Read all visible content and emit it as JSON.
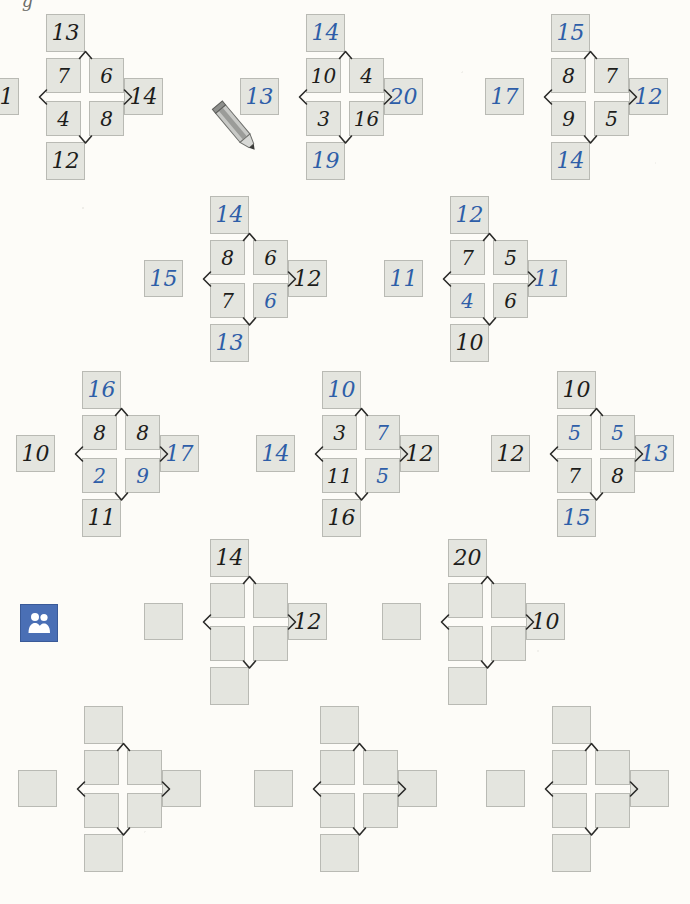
{
  "page": {
    "type": "math-worksheet",
    "topic": "cross-number-puzzles",
    "top_mark": "g",
    "colors": {
      "paper": "#fdfcf8",
      "box_fill": "#e4e5df",
      "box_border": "#b9bab4",
      "given_number": "#1d1d1b",
      "answer_number": "#2e5ea8",
      "partner_icon_bg": "#4a6fb5"
    }
  },
  "icons": {
    "pencil": "pencil-icon",
    "partner": "partner-work-icon"
  },
  "puzzles": [
    {
      "id": 1,
      "left": 8,
      "top": 20,
      "cells": {
        "tl": "7",
        "tr": "6",
        "bl": "4",
        "br": "8"
      },
      "colors": {
        "tl": "black",
        "tr": "black",
        "bl": "black",
        "br": "black"
      },
      "outer": {
        "top": "13",
        "bottom": "12",
        "left": "11",
        "right": "14"
      },
      "outer_colors": {
        "top": "black",
        "bottom": "black",
        "left": "black",
        "right": "black"
      }
    },
    {
      "id": 2,
      "left": 268,
      "top": 20,
      "cells": {
        "tl": "10",
        "tr": "4",
        "bl": "3",
        "br": "16"
      },
      "colors": {
        "tl": "black",
        "tr": "black",
        "bl": "black",
        "br": "black"
      },
      "outer": {
        "top": "14",
        "bottom": "19",
        "left": "13",
        "right": "20"
      },
      "outer_colors": {
        "top": "blue",
        "bottom": "blue",
        "left": "blue",
        "right": "blue"
      }
    },
    {
      "id": 3,
      "left": 513,
      "top": 20,
      "cells": {
        "tl": "8",
        "tr": "7",
        "bl": "9",
        "br": "5"
      },
      "colors": {
        "tl": "black",
        "tr": "black",
        "bl": "black",
        "br": "black"
      },
      "outer": {
        "top": "15",
        "bottom": "14",
        "left": "17",
        "right": "12"
      },
      "outer_colors": {
        "top": "blue",
        "bottom": "blue",
        "left": "blue",
        "right": "blue"
      }
    },
    {
      "id": 4,
      "left": 172,
      "top": 202,
      "cells": {
        "tl": "8",
        "tr": "6",
        "bl": "7",
        "br": "6"
      },
      "colors": {
        "tl": "black",
        "tr": "black",
        "bl": "black",
        "br": "blue"
      },
      "outer": {
        "top": "14",
        "bottom": "13",
        "left": "15",
        "right": "12"
      },
      "outer_colors": {
        "top": "blue",
        "bottom": "blue",
        "left": "blue",
        "right": "black"
      }
    },
    {
      "id": 5,
      "left": 412,
      "top": 202,
      "cells": {
        "tl": "7",
        "tr": "5",
        "bl": "4",
        "br": "6"
      },
      "colors": {
        "tl": "black",
        "tr": "black",
        "bl": "blue",
        "br": "black"
      },
      "outer": {
        "top": "12",
        "bottom": "10",
        "left": "11",
        "right": "11"
      },
      "outer_colors": {
        "top": "blue",
        "bottom": "black",
        "left": "blue",
        "right": "blue"
      }
    },
    {
      "id": 6,
      "left": 44,
      "top": 377,
      "cells": {
        "tl": "8",
        "tr": "8",
        "bl": "2",
        "br": "9"
      },
      "colors": {
        "tl": "black",
        "tr": "black",
        "bl": "blue",
        "br": "blue"
      },
      "outer": {
        "top": "16",
        "bottom": "11",
        "left": "10",
        "right": "17"
      },
      "outer_colors": {
        "top": "blue",
        "bottom": "black",
        "left": "black",
        "right": "blue"
      }
    },
    {
      "id": 7,
      "left": 284,
      "top": 377,
      "cells": {
        "tl": "3",
        "tr": "7",
        "bl": "11",
        "br": "5"
      },
      "colors": {
        "tl": "black",
        "tr": "blue",
        "bl": "black",
        "br": "blue"
      },
      "outer": {
        "top": "10",
        "bottom": "16",
        "left": "14",
        "right": "12"
      },
      "outer_colors": {
        "top": "blue",
        "bottom": "black",
        "left": "blue",
        "right": "black"
      }
    },
    {
      "id": 8,
      "left": 519,
      "top": 377,
      "cells": {
        "tl": "5",
        "tr": "5",
        "bl": "7",
        "br": "8"
      },
      "colors": {
        "tl": "blue",
        "tr": "blue",
        "bl": "black",
        "br": "black"
      },
      "outer": {
        "top": "10",
        "bottom": "15",
        "left": "12",
        "right": "13"
      },
      "outer_colors": {
        "top": "black",
        "bottom": "blue",
        "left": "black",
        "right": "blue"
      }
    },
    {
      "id": 9,
      "left": 172,
      "top": 545,
      "cells": {
        "tl": "",
        "tr": "",
        "bl": "",
        "br": ""
      },
      "colors": {
        "tl": "black",
        "tr": "black",
        "bl": "black",
        "br": "black"
      },
      "outer": {
        "top": "14",
        "bottom": "",
        "left": "",
        "right": "12"
      },
      "outer_colors": {
        "top": "black",
        "bottom": "black",
        "left": "black",
        "right": "black"
      }
    },
    {
      "id": 10,
      "left": 410,
      "top": 545,
      "cells": {
        "tl": "",
        "tr": "",
        "bl": "",
        "br": ""
      },
      "colors": {
        "tl": "black",
        "tr": "black",
        "bl": "black",
        "br": "black"
      },
      "outer": {
        "top": "20",
        "bottom": "",
        "left": "",
        "right": "10"
      },
      "outer_colors": {
        "top": "black",
        "bottom": "black",
        "left": "black",
        "right": "black"
      }
    },
    {
      "id": 11,
      "left": 46,
      "top": 712,
      "cells": {
        "tl": "",
        "tr": "",
        "bl": "",
        "br": ""
      },
      "colors": {
        "tl": "black",
        "tr": "black",
        "bl": "black",
        "br": "black"
      },
      "outer": {
        "top": "",
        "bottom": "",
        "left": "",
        "right": ""
      },
      "outer_colors": {
        "top": "black",
        "bottom": "black",
        "left": "black",
        "right": "black"
      }
    },
    {
      "id": 12,
      "left": 282,
      "top": 712,
      "cells": {
        "tl": "",
        "tr": "",
        "bl": "",
        "br": ""
      },
      "colors": {
        "tl": "black",
        "tr": "black",
        "bl": "black",
        "br": "black"
      },
      "outer": {
        "top": "",
        "bottom": "",
        "left": "",
        "right": ""
      },
      "outer_colors": {
        "top": "black",
        "bottom": "black",
        "left": "black",
        "right": "black"
      }
    },
    {
      "id": 13,
      "left": 514,
      "top": 712,
      "cells": {
        "tl": "",
        "tr": "",
        "bl": "",
        "br": ""
      },
      "colors": {
        "tl": "black",
        "tr": "black",
        "bl": "black",
        "br": "black"
      },
      "outer": {
        "top": "",
        "bottom": "",
        "left": "",
        "right": ""
      },
      "outer_colors": {
        "top": "black",
        "bottom": "black",
        "left": "black",
        "right": "black"
      }
    }
  ]
}
